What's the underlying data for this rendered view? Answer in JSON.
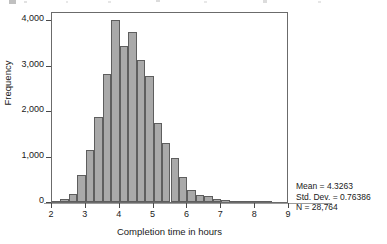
{
  "figure": {
    "name": "completion-time-histogram"
  },
  "chart_data": {
    "type": "bar",
    "chart_subtype": "histogram",
    "title": "",
    "xlabel": "Completion time in hours",
    "ylabel": "Frequency",
    "xlim": [
      2,
      9
    ],
    "ylim": [
      0,
      4200
    ],
    "grid": false,
    "legend": false,
    "bin_width": 0.25,
    "x_ticks": [
      "2",
      "3",
      "4",
      "5",
      "6",
      "7",
      "8",
      "9"
    ],
    "x_tick_values": [
      2,
      3,
      4,
      5,
      6,
      7,
      8,
      9
    ],
    "y_ticks": [
      "0",
      "1,000",
      "2,000",
      "3,000",
      "4,000"
    ],
    "y_tick_values": [
      0,
      1000,
      2000,
      3000,
      4000
    ],
    "bin_starts": [
      2.0,
      2.25,
      2.5,
      2.75,
      3.0,
      3.25,
      3.5,
      3.75,
      4.0,
      4.25,
      4.5,
      4.75,
      5.0,
      5.25,
      5.5,
      5.75,
      6.0,
      6.25,
      6.5,
      6.75,
      7.0,
      7.25,
      7.5,
      7.75,
      8.0,
      8.25
    ],
    "categories": [
      "2.00-2.25",
      "2.25-2.50",
      "2.50-2.75",
      "2.75-3.00",
      "3.00-3.25",
      "3.25-3.50",
      "3.50-3.75",
      "3.75-4.00",
      "4.00-4.25",
      "4.25-4.50",
      "4.50-4.75",
      "4.75-5.00",
      "5.00-5.25",
      "5.25-5.50",
      "5.50-5.75",
      "5.75-6.00",
      "6.00-6.25",
      "6.25-6.50",
      "6.50-6.75",
      "6.75-7.00",
      "7.00-7.25",
      "7.25-7.50",
      "7.50-7.75",
      "7.75-8.00",
      "8.00-8.25",
      "8.25-8.50"
    ],
    "values": [
      25,
      75,
      175,
      590,
      1150,
      1880,
      2820,
      4000,
      3420,
      3730,
      3130,
      2780,
      1730,
      1300,
      960,
      540,
      270,
      150,
      130,
      70,
      45,
      25,
      15,
      8,
      5,
      3
    ],
    "annotations": {
      "mean_label": "Mean = 4.3263",
      "std_dev_label": "Std. Dev. = 0.76386",
      "n_label": "N = 28,764",
      "mean": 4.3263,
      "std_dev": 0.76386,
      "n": 28764
    },
    "colors": {
      "bar_fill": "#a9a9a9",
      "bar_border": "#5e5e5e",
      "frame": "#6b6b6b",
      "text": "#1a1a1a",
      "axis_rule": "#9a9a9a"
    }
  }
}
